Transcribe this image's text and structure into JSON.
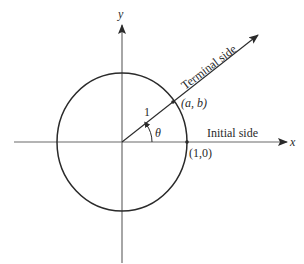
{
  "diagram": {
    "type": "unit-circle-angle",
    "axes": {
      "x_label": "x",
      "y_label": "y"
    },
    "labels": {
      "terminal_side": "Terminal side",
      "initial_side": "Initial side",
      "radius": "1",
      "angle": "θ",
      "point_ab": "(a, b)",
      "point_10": "(1,0)"
    },
    "colors": {
      "stroke": "#2a2a2a",
      "axis": "#6b6b6b",
      "background": "#ffffff"
    }
  }
}
